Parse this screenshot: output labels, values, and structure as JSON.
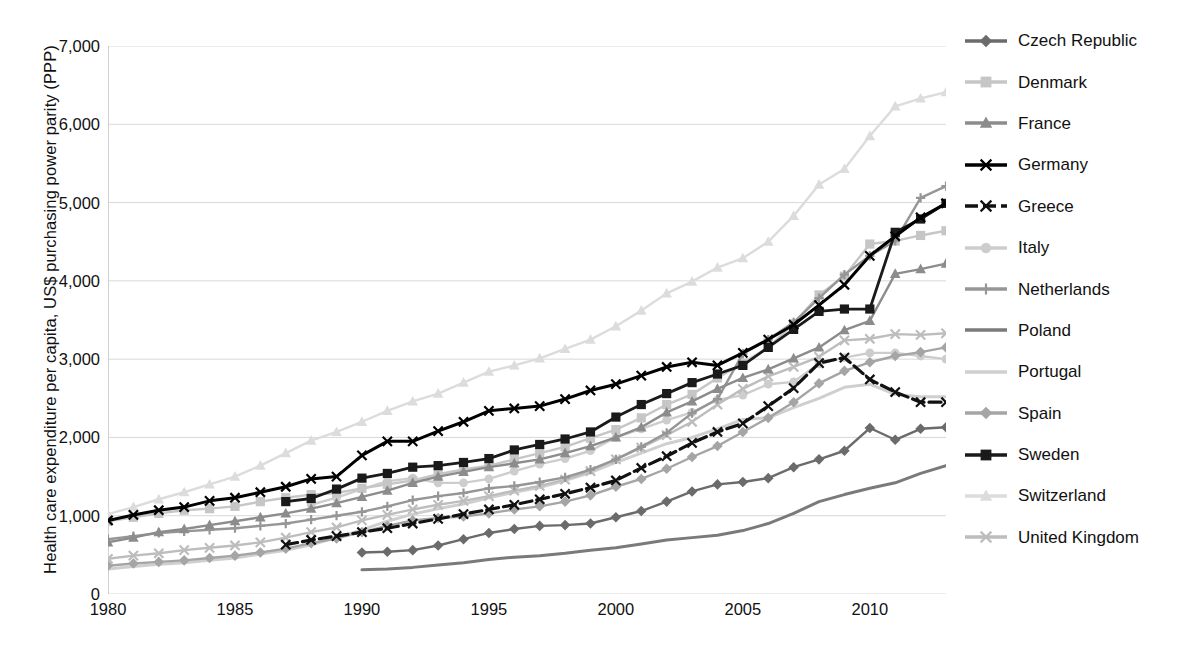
{
  "chart_data": {
    "type": "line",
    "title": "",
    "xlabel": "",
    "ylabel": "Health care expenditure per capita, US$ purchasing power parity (PPP)",
    "xlim": [
      1980,
      2013
    ],
    "ylim": [
      0,
      7000
    ],
    "grid": "horizontal",
    "legend_position": "right",
    "xticks": [
      "1980",
      "1985",
      "1990",
      "1995",
      "2000",
      "2005",
      "2010"
    ],
    "xtick_values": [
      1980,
      1985,
      1990,
      1995,
      2000,
      2005,
      2010
    ],
    "yticks": [
      "0",
      "1,000",
      "2,000",
      "3,000",
      "4,000",
      "5,000",
      "6,000",
      "7,000"
    ],
    "ytick_values": [
      0,
      1000,
      2000,
      3000,
      4000,
      5000,
      6000,
      7000
    ],
    "x": [
      1980,
      1981,
      1982,
      1983,
      1984,
      1985,
      1986,
      1987,
      1988,
      1989,
      1990,
      1991,
      1992,
      1993,
      1994,
      1995,
      1996,
      1997,
      1998,
      1999,
      2000,
      2001,
      2002,
      2003,
      2004,
      2005,
      2006,
      2007,
      2008,
      2009,
      2010,
      2011,
      2012,
      2013
    ],
    "series": [
      {
        "name": "Czech Republic",
        "color": "#6b6b6b",
        "marker": "diamond",
        "dash": "solid",
        "width": 2.4,
        "x": [
          1990,
          1991,
          1992,
          1993,
          1994,
          1995,
          1996,
          1997,
          1998,
          1999,
          2000,
          2001,
          2002,
          2003,
          2004,
          2005,
          2006,
          2007,
          2008,
          2009,
          2010,
          2011,
          2012,
          2013
        ],
        "values": [
          530,
          540,
          560,
          620,
          700,
          780,
          830,
          870,
          880,
          900,
          980,
          1060,
          1180,
          1310,
          1400,
          1430,
          1480,
          1620,
          1720,
          1830,
          2120,
          1970,
          2110,
          2130
        ]
      },
      {
        "name": "Denmark",
        "color": "#c6c6c6",
        "marker": "square",
        "dash": "solid",
        "width": 2.4,
        "x": [
          1980,
          1981,
          1982,
          1983,
          1984,
          1985,
          1986,
          1987,
          1988,
          1989,
          1990,
          1991,
          1992,
          1993,
          1994,
          1995,
          1996,
          1997,
          1998,
          1999,
          2000,
          2001,
          2002,
          2003,
          2004,
          2005,
          2006,
          2007,
          2008,
          2009,
          2010,
          2011,
          2012,
          2013
        ],
        "values": [
          930,
          980,
          1030,
          1070,
          1090,
          1120,
          1180,
          1230,
          1270,
          1290,
          1350,
          1400,
          1450,
          1530,
          1590,
          1640,
          1720,
          1800,
          1880,
          1990,
          2100,
          2250,
          2420,
          2550,
          2760,
          2950,
          3150,
          3450,
          3820,
          4060,
          4470,
          4510,
          4580,
          4640
        ]
      },
      {
        "name": "France",
        "color": "#8c8c8c",
        "marker": "triangle",
        "dash": "solid",
        "width": 2.4,
        "x": [
          1980,
          1981,
          1982,
          1983,
          1984,
          1985,
          1986,
          1987,
          1988,
          1989,
          1990,
          1991,
          1992,
          1993,
          1994,
          1995,
          1996,
          1997,
          1998,
          1999,
          2000,
          2001,
          2002,
          2003,
          2004,
          2005,
          2006,
          2007,
          2008,
          2009,
          2010,
          2011,
          2012,
          2013
        ],
        "values": [
          660,
          720,
          790,
          830,
          880,
          930,
          980,
          1030,
          1090,
          1160,
          1240,
          1320,
          1420,
          1500,
          1560,
          1620,
          1670,
          1720,
          1800,
          1890,
          2000,
          2130,
          2320,
          2460,
          2620,
          2760,
          2870,
          3010,
          3150,
          3370,
          3490,
          4090,
          4150,
          4220
        ]
      },
      {
        "name": "Germany",
        "color": "#000000",
        "marker": "x",
        "dash": "solid",
        "width": 3.0,
        "x": [
          1980,
          1981,
          1982,
          1983,
          1984,
          1985,
          1986,
          1987,
          1988,
          1989,
          1990,
          1991,
          1992,
          1993,
          1994,
          1995,
          1996,
          1997,
          1998,
          1999,
          2000,
          2001,
          2002,
          2003,
          2004,
          2005,
          2006,
          2007,
          2008,
          2009,
          2010,
          2011,
          2012,
          2013
        ],
        "values": [
          940,
          1010,
          1070,
          1110,
          1190,
          1230,
          1300,
          1370,
          1470,
          1500,
          1770,
          1950,
          1950,
          2080,
          2200,
          2340,
          2370,
          2400,
          2490,
          2600,
          2680,
          2790,
          2900,
          2960,
          2920,
          3080,
          3250,
          3440,
          3690,
          3950,
          4320,
          4570,
          4810,
          4990
        ]
      },
      {
        "name": "Greece",
        "color": "#111111",
        "marker": "x",
        "dash": "dash",
        "width": 3.2,
        "x": [
          1987,
          1988,
          1989,
          1990,
          1991,
          1992,
          1993,
          1994,
          1995,
          1996,
          1997,
          1998,
          1999,
          2000,
          2001,
          2002,
          2003,
          2004,
          2005,
          2006,
          2007,
          2008,
          2009,
          2010,
          2011,
          2012,
          2013
        ],
        "values": [
          630,
          690,
          740,
          790,
          840,
          900,
          960,
          1020,
          1080,
          1140,
          1210,
          1280,
          1360,
          1450,
          1610,
          1760,
          1930,
          2070,
          2180,
          2400,
          2630,
          2950,
          3020,
          2740,
          2580,
          2450,
          2450
        ]
      },
      {
        "name": "Italy",
        "color": "#cdcdcd",
        "marker": "circle",
        "dash": "solid",
        "width": 2.4,
        "x": [
          1988,
          1989,
          1990,
          1991,
          1992,
          1993,
          1994,
          1995,
          1996,
          1997,
          1998,
          1999,
          2000,
          2001,
          2002,
          2003,
          2004,
          2005,
          2006,
          2007,
          2008,
          2009,
          2010,
          2011,
          2012,
          2013
        ],
        "values": [
          1140,
          1230,
          1340,
          1440,
          1480,
          1420,
          1420,
          1470,
          1570,
          1660,
          1730,
          1830,
          2000,
          2110,
          2220,
          2320,
          2480,
          2540,
          2680,
          2710,
          2940,
          3020,
          3080,
          3080,
          3040,
          3000
        ]
      },
      {
        "name": "Netherlands",
        "color": "#969696",
        "marker": "plus",
        "dash": "solid",
        "width": 2.4,
        "x": [
          1980,
          1981,
          1982,
          1983,
          1984,
          1985,
          1986,
          1987,
          1988,
          1989,
          1990,
          1991,
          1992,
          1993,
          1994,
          1995,
          1996,
          1997,
          1998,
          1999,
          2000,
          2001,
          2002,
          2003,
          2004,
          2005,
          2006,
          2007,
          2008,
          2009,
          2010,
          2011,
          2012,
          2013
        ],
        "values": [
          700,
          740,
          780,
          800,
          820,
          840,
          870,
          900,
          950,
          1000,
          1050,
          1120,
          1200,
          1250,
          1290,
          1350,
          1380,
          1430,
          1490,
          1590,
          1720,
          1880,
          2060,
          2310,
          2490,
          3070,
          3250,
          3470,
          3780,
          4080,
          4320,
          4510,
          5060,
          5210
        ]
      },
      {
        "name": "Poland",
        "color": "#7a7a7a",
        "marker": "none",
        "dash": "solid",
        "width": 3.0,
        "x": [
          1990,
          1991,
          1992,
          1993,
          1994,
          1995,
          1996,
          1997,
          1998,
          1999,
          2000,
          2001,
          2002,
          2003,
          2004,
          2005,
          2006,
          2007,
          2008,
          2009,
          2010,
          2011,
          2012,
          2013
        ],
        "values": [
          310,
          320,
          340,
          370,
          400,
          440,
          470,
          490,
          520,
          560,
          590,
          640,
          690,
          720,
          750,
          810,
          900,
          1030,
          1180,
          1270,
          1350,
          1420,
          1540,
          1640
        ]
      },
      {
        "name": "Portugal",
        "color": "#cfcfcf",
        "marker": "none",
        "dash": "solid",
        "width": 3.0,
        "x": [
          1980,
          1981,
          1982,
          1983,
          1984,
          1985,
          1986,
          1987,
          1988,
          1989,
          1990,
          1991,
          1992,
          1993,
          1994,
          1995,
          1996,
          1997,
          1998,
          1999,
          2000,
          2001,
          2002,
          2003,
          2004,
          2005,
          2006,
          2007,
          2008,
          2009,
          2010,
          2011,
          2012,
          2013
        ],
        "values": [
          320,
          350,
          380,
          400,
          430,
          460,
          510,
          560,
          630,
          720,
          820,
          930,
          1020,
          1090,
          1150,
          1230,
          1300,
          1360,
          1450,
          1550,
          1680,
          1800,
          1920,
          2000,
          2110,
          2230,
          2250,
          2380,
          2500,
          2640,
          2680,
          2550,
          2520,
          2520
        ]
      },
      {
        "name": "Spain",
        "color": "#a5a5a5",
        "marker": "diamond",
        "dash": "solid",
        "width": 2.4,
        "x": [
          1980,
          1981,
          1982,
          1983,
          1984,
          1985,
          1986,
          1987,
          1988,
          1989,
          1990,
          1991,
          1992,
          1993,
          1994,
          1995,
          1996,
          1997,
          1998,
          1999,
          2000,
          2001,
          2002,
          2003,
          2004,
          2005,
          2006,
          2007,
          2008,
          2009,
          2010,
          2011,
          2012,
          2013
        ],
        "values": [
          360,
          390,
          410,
          430,
          460,
          490,
          530,
          580,
          650,
          710,
          790,
          870,
          940,
          970,
          990,
          1030,
          1080,
          1120,
          1180,
          1260,
          1370,
          1470,
          1600,
          1750,
          1890,
          2070,
          2250,
          2450,
          2690,
          2850,
          2960,
          3040,
          3090,
          3150
        ]
      },
      {
        "name": "Sweden",
        "color": "#1a1a1a",
        "marker": "square",
        "dash": "solid",
        "width": 2.8,
        "x": [
          1987,
          1988,
          1989,
          1990,
          1991,
          1992,
          1993,
          1994,
          1995,
          1996,
          1997,
          1998,
          1999,
          2000,
          2001,
          2002,
          2003,
          2004,
          2005,
          2006,
          2007,
          2008,
          2009,
          2010,
          2011,
          2012,
          2013
        ],
        "values": [
          1180,
          1220,
          1340,
          1480,
          1540,
          1620,
          1640,
          1680,
          1730,
          1840,
          1910,
          1980,
          2070,
          2260,
          2420,
          2560,
          2700,
          2810,
          2920,
          3150,
          3380,
          3610,
          3640,
          3640,
          4620,
          4790,
          4990
        ]
      },
      {
        "name": "Switzerland",
        "color": "#dcdcdc",
        "marker": "triangle",
        "dash": "solid",
        "width": 2.4,
        "x": [
          1980,
          1981,
          1982,
          1983,
          1984,
          1985,
          1986,
          1987,
          1988,
          1989,
          1990,
          1991,
          1992,
          1993,
          1994,
          1995,
          1996,
          1997,
          1998,
          1999,
          2000,
          2001,
          2002,
          2003,
          2004,
          2005,
          2006,
          2007,
          2008,
          2009,
          2010,
          2011,
          2012,
          2013
        ],
        "values": [
          1020,
          1110,
          1210,
          1300,
          1400,
          1500,
          1640,
          1800,
          1960,
          2070,
          2200,
          2340,
          2460,
          2560,
          2700,
          2840,
          2920,
          3010,
          3130,
          3250,
          3420,
          3620,
          3840,
          3990,
          4170,
          4290,
          4500,
          4830,
          5230,
          5430,
          5850,
          6230,
          6330,
          6410
        ]
      },
      {
        "name": "United Kingdom",
        "color": "#bdbdbd",
        "marker": "x",
        "dash": "solid",
        "width": 2.4,
        "x": [
          1980,
          1981,
          1982,
          1983,
          1984,
          1985,
          1986,
          1987,
          1988,
          1989,
          1990,
          1991,
          1992,
          1993,
          1994,
          1995,
          1996,
          1997,
          1998,
          1999,
          2000,
          2001,
          2002,
          2003,
          2004,
          2005,
          2006,
          2007,
          2008,
          2009,
          2010,
          2011,
          2012,
          2013
        ],
        "values": [
          450,
          490,
          520,
          560,
          590,
          620,
          660,
          720,
          790,
          850,
          940,
          1010,
          1080,
          1140,
          1190,
          1250,
          1320,
          1380,
          1460,
          1570,
          1720,
          1870,
          2030,
          2200,
          2420,
          2620,
          2780,
          2900,
          3030,
          3240,
          3260,
          3320,
          3310,
          3330
        ]
      }
    ]
  },
  "legend": {
    "items": [
      {
        "label": "Czech Republic"
      },
      {
        "label": "Denmark"
      },
      {
        "label": "France"
      },
      {
        "label": "Germany"
      },
      {
        "label": "Greece"
      },
      {
        "label": "Italy"
      },
      {
        "label": "Netherlands"
      },
      {
        "label": "Poland"
      },
      {
        "label": "Portugal"
      },
      {
        "label": "Spain"
      },
      {
        "label": "Sweden"
      },
      {
        "label": "Switzerland"
      },
      {
        "label": "United Kingdom"
      }
    ]
  }
}
